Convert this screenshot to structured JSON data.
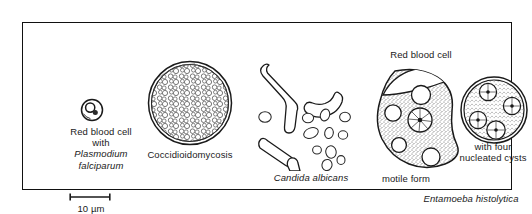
{
  "figure": {
    "name": "microbiology-specimen-plate",
    "border_color": "#111111",
    "ink_color": "#1a1a1a",
    "background_color": "#ffffff"
  },
  "panels": {
    "rbc_plasmodium": {
      "label_line1": "Red blood cell",
      "label_line2": "with",
      "label_line3": "Plasmodium",
      "label_line4": "falciparum",
      "icon": "ring-form-trophozoite-in-erythrocyte"
    },
    "coccidioides": {
      "label": "Coccidioidomycosis",
      "icon": "endospore-filled-spherule"
    },
    "candida": {
      "label": "Candida albicans",
      "icon": "pseudohyphae-and-budding-yeast"
    },
    "entamoeba_motile": {
      "top_label": "Red blood cell",
      "bottom_label": "motile form",
      "icon": "amoeboid-trophozoite"
    },
    "entamoeba_cyst": {
      "label_line1": "with four",
      "label_line2": "nucleated cysts",
      "icon": "quadrinucleate-cyst"
    },
    "entamoeba_genus": {
      "label": "Entamoeba histolytica"
    }
  },
  "scale": {
    "value": "10",
    "unit": "µm",
    "label": "10 µm"
  }
}
